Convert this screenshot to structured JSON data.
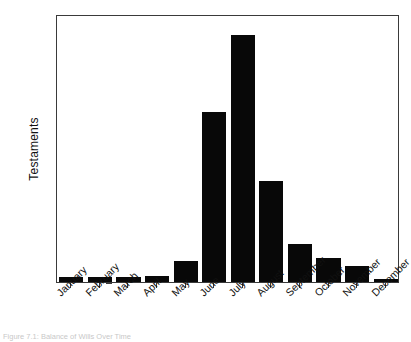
{
  "chart_data": {
    "type": "bar",
    "title": "",
    "xlabel": "",
    "ylabel": "Testaments",
    "categories": [
      "January",
      "February",
      "March",
      "April",
      "May",
      "June",
      "July",
      "August",
      "September",
      "October",
      "November",
      "December"
    ],
    "values": [
      10,
      10,
      10,
      12,
      40,
      318,
      460,
      188,
      70,
      45,
      30,
      5
    ],
    "ylim": [
      0,
      500
    ],
    "yticks": [
      0,
      100,
      200,
      300,
      400,
      500
    ],
    "ytick_labels": [
      "0",
      "100",
      "200",
      "300",
      "400",
      "500"
    ],
    "grid": false,
    "legend": null,
    "bar_color": "#080808",
    "frame_color": "#3a3a3a",
    "background": "#ffffff",
    "xtick_label_rotation": -45
  },
  "caption": {
    "text": "Figure 7.1: Balance of Wills Over Time"
  }
}
